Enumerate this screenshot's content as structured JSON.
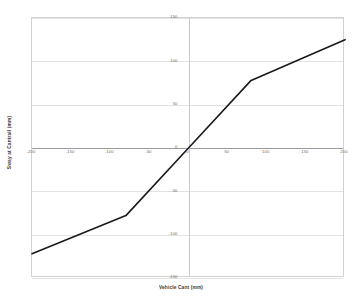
{
  "chart_data": {
    "type": "line",
    "title": "",
    "xlabel": "Vehicle Cant (mm)",
    "ylabel": "Sway at Cantrail (mm)",
    "xlim": [
      -200,
      200
    ],
    "ylim": [
      -150,
      150
    ],
    "xticks": [
      -200,
      -150,
      -100,
      -50,
      0,
      50,
      100,
      150,
      200
    ],
    "yticks": [
      150,
      100,
      50,
      0,
      -50,
      -100,
      -150
    ],
    "xtick_labels": [
      "-200",
      "-150",
      "-100",
      "-50",
      "0",
      "50",
      "100",
      "150",
      "200"
    ],
    "ytick_labels": [
      "150",
      "100",
      "50",
      "0",
      "-50",
      "-100",
      "-150"
    ],
    "grid": true,
    "legend": false,
    "series": [
      {
        "name": "Sway at Cantrail",
        "color": "#1a1a1a",
        "line_width": 1.6,
        "x": [
          -200,
          -80,
          0,
          80,
          200
        ],
        "y": [
          -122,
          -78,
          0,
          78,
          125
        ]
      }
    ]
  }
}
